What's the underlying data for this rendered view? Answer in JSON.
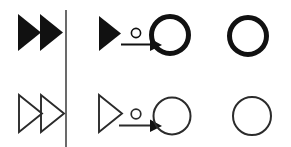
{
  "figure": {
    "title": "Abstract glyph diagram: filled (bold) variants over outlined (thin) variants",
    "width": 291,
    "height": 147,
    "background_color": "#ffffff",
    "stroke_color": "#111111",
    "fill_color": "#111111",
    "rows": [
      {
        "id": "row-bold",
        "style": "filled-bold",
        "stroke_width_px": 5,
        "cells": [
          {
            "id": "cell-bold-double-triangle",
            "name": "double-filled-triangle",
            "description": "Two solid right-pointing triangles side by side",
            "glyphs": [
              "filled-triangle",
              "filled-triangle"
            ]
          },
          {
            "id": "cell-bold-triangle-arrow-circle",
            "name": "filled-triangle-arrow-thick-circle",
            "description": "Solid right-pointing triangle, small open circle above an arrow, arrow pointing into a thick circle",
            "glyphs": [
              "filled-triangle",
              "small-circle",
              "arrow-right",
              "thick-circle"
            ]
          },
          {
            "id": "cell-bold-circle",
            "name": "thick-circle",
            "description": "A single thick-stroked circle",
            "glyphs": [
              "thick-circle"
            ]
          }
        ]
      },
      {
        "id": "row-thin",
        "style": "outline-thin",
        "stroke_width_px": 2,
        "cells": [
          {
            "id": "cell-thin-double-triangle",
            "name": "double-outline-triangle",
            "description": "Two outlined right-pointing triangles side by side",
            "glyphs": [
              "outline-triangle",
              "outline-triangle"
            ]
          },
          {
            "id": "cell-thin-triangle-arrow-circle",
            "name": "outline-triangle-arrow-thin-circle",
            "description": "Outlined right-pointing triangle, small open circle above an arrow, arrow pointing into a thin circle",
            "glyphs": [
              "outline-triangle",
              "small-circle",
              "arrow-right",
              "thin-circle"
            ]
          },
          {
            "id": "cell-thin-circle",
            "name": "thin-circle",
            "description": "A single thin-stroked circle",
            "glyphs": [
              "thin-circle"
            ]
          }
        ]
      }
    ],
    "divider": {
      "name": "vertical-divider",
      "orientation": "vertical",
      "x": 66,
      "y_start": 10,
      "y_end": 147,
      "stroke_width_px": 1.4
    }
  }
}
